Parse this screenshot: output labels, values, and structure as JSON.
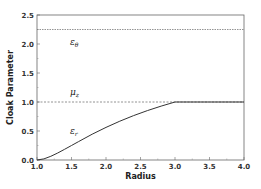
{
  "chart_data": {
    "type": "line",
    "title": "",
    "xlabel": "Radius",
    "ylabel": "Cloak Parameter",
    "xlim": [
      1.0,
      4.0
    ],
    "ylim": [
      0.0,
      2.5
    ],
    "x_ticks": [
      "1.0",
      "1.5",
      "2.0",
      "2.5",
      "3.0",
      "3.5",
      "4.0"
    ],
    "y_ticks": [
      "0.0",
      "0.5",
      "1.0",
      "1.5",
      "2.0",
      "2.5"
    ],
    "grid": false,
    "legend": "none (inline labels)",
    "series": [
      {
        "name": "ε_θ",
        "label": "ε",
        "subscript": "θ",
        "style": "dotted",
        "x": [
          1.0,
          4.0
        ],
        "values": [
          2.25,
          2.25
        ]
      },
      {
        "name": "μ_z",
        "label": "μ",
        "subscript": "z",
        "style": "dashed",
        "x": [
          1.0,
          4.0
        ],
        "values": [
          1.0,
          1.0
        ]
      },
      {
        "name": "ε_r",
        "label": "ε",
        "subscript": "r",
        "style": "solid",
        "x": [
          1.0,
          1.1,
          1.2,
          1.3,
          1.4,
          1.5,
          1.6,
          1.8,
          2.0,
          2.2,
          2.4,
          2.6,
          2.8,
          3.0,
          3.5,
          4.0
        ],
        "values": [
          0.0,
          0.019,
          0.063,
          0.12,
          0.184,
          0.25,
          0.316,
          0.444,
          0.5625,
          0.669,
          0.766,
          0.852,
          0.93,
          1.0,
          1.0,
          1.0
        ]
      }
    ],
    "colors": {
      "line": "#222222",
      "axis": "#555555",
      "background": "#ffffff"
    }
  }
}
